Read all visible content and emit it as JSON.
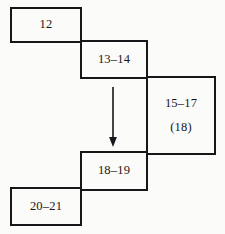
{
  "diagram": {
    "background_color": "#fbfbf9",
    "line_color": "#17171a",
    "boxes": [
      {
        "id": "box-12",
        "label": "12",
        "label2": ""
      },
      {
        "id": "box-13-14",
        "label": "13–14",
        "label2": ""
      },
      {
        "id": "box-15-17",
        "label": "15–17",
        "label2": "(18)"
      },
      {
        "id": "box-18-19",
        "label": "18–19",
        "label2": ""
      },
      {
        "id": "box-20-21",
        "label": "20–21",
        "label2": ""
      }
    ],
    "arrow": {
      "name": "down-arrow",
      "direction": "down",
      "color": "#17171a"
    }
  }
}
